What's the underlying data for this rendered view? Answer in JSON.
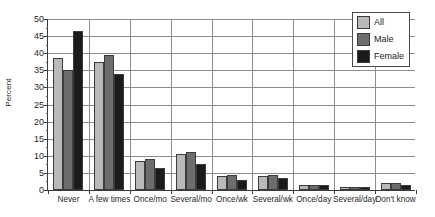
{
  "chart_data": {
    "type": "bar",
    "title": "",
    "xlabel": "",
    "ylabel": "Percent",
    "ylim": [
      0,
      50
    ],
    "ytick_step": 5,
    "yticks": [
      0,
      5,
      10,
      15,
      20,
      25,
      30,
      35,
      40,
      45,
      50
    ],
    "ytick_labels": [
      "0",
      "5",
      "10",
      "15",
      "20",
      "25",
      "30",
      "35",
      "40",
      "45",
      "50"
    ],
    "grid": true,
    "legend_position": "top-right",
    "categories": [
      "Never",
      "A few times",
      "Once/mo",
      "Several/mo",
      "Once/wk",
      "Several/wk",
      "Once/day",
      "Several/day",
      "Don't know"
    ],
    "series": [
      {
        "name": "All",
        "color": "#b9b9b9",
        "values": [
          38.5,
          37.5,
          8.5,
          10.5,
          4.0,
          4.0,
          1.5,
          1.0,
          2.0
        ]
      },
      {
        "name": "Male",
        "color": "#6d6d6d",
        "values": [
          35.0,
          39.5,
          9.0,
          11.0,
          4.5,
          4.5,
          1.5,
          1.0,
          2.0
        ]
      },
      {
        "name": "Female",
        "color": "#1b1b1b",
        "values": [
          46.5,
          34.0,
          6.5,
          7.5,
          3.0,
          3.5,
          1.5,
          1.0,
          1.5
        ]
      }
    ]
  },
  "legend": {
    "items": [
      {
        "label": "All"
      },
      {
        "label": "Male"
      },
      {
        "label": "Female"
      }
    ]
  },
  "axis": {
    "y_title": "Percent"
  }
}
